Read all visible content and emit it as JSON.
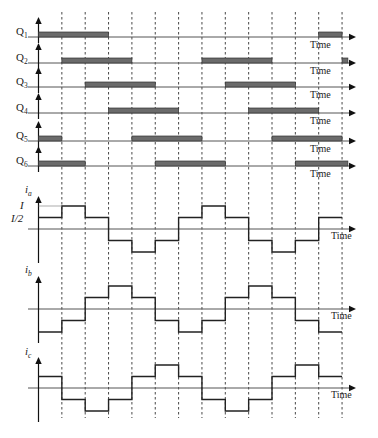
{
  "colors": {
    "bar": "#6b6b6b",
    "line": "#222222",
    "background": "#ffffff"
  },
  "axis_label": "Time",
  "gate_signals": [
    {
      "name": "Q",
      "sub": "1",
      "on_intervals": [
        [
          0,
          3
        ],
        [
          12,
          13
        ]
      ]
    },
    {
      "name": "Q",
      "sub": "2",
      "on_intervals": [
        [
          1,
          4
        ],
        [
          7,
          10
        ],
        [
          13,
          13.25
        ]
      ]
    },
    {
      "name": "Q",
      "sub": "3",
      "on_intervals": [
        [
          2,
          5
        ],
        [
          8,
          11
        ]
      ]
    },
    {
      "name": "Q",
      "sub": "4",
      "on_intervals": [
        [
          3,
          6
        ],
        [
          9,
          12
        ]
      ]
    },
    {
      "name": "Q",
      "sub": "5",
      "on_intervals": [
        [
          0,
          1
        ],
        [
          4,
          7
        ],
        [
          10,
          13
        ]
      ]
    },
    {
      "name": "Q",
      "sub": "6",
      "on_intervals": [
        [
          0,
          2
        ],
        [
          5,
          8
        ],
        [
          11,
          13.25
        ]
      ]
    }
  ],
  "currents": [
    {
      "name": "i",
      "sub": "a",
      "levels_label_top": "I",
      "levels_label_mid": "I/2",
      "levels": [
        0.5,
        1,
        0.5,
        -0.5,
        -1,
        -0.5,
        0.5,
        1,
        0.5,
        -0.5,
        -1,
        -0.5,
        0.5
      ]
    },
    {
      "name": "i",
      "sub": "b",
      "levels": [
        -1,
        -0.5,
        0.5,
        1,
        0.5,
        -0.5,
        -1,
        -0.5,
        0.5,
        1,
        0.5,
        -0.5,
        -1
      ]
    },
    {
      "name": "i",
      "sub": "c",
      "levels": [
        0.5,
        -0.5,
        -1,
        -0.5,
        0.5,
        1,
        0.5,
        -0.5,
        -1,
        -0.5,
        0.5,
        1,
        0.5
      ]
    }
  ],
  "chart_data": {
    "type": "line",
    "xlabel": "Time",
    "x_intervals": 13,
    "interval_labels": [
      "0",
      "1",
      "2",
      "3",
      "4",
      "5",
      "6",
      "7",
      "8",
      "9",
      "10",
      "11",
      "12",
      "13"
    ],
    "grid": "vertical dashed lines at each interval boundary",
    "gate_series": [
      {
        "name": "Q1",
        "on": [
          [
            0,
            3
          ],
          [
            12,
            13
          ]
        ]
      },
      {
        "name": "Q2",
        "on": [
          [
            1,
            4
          ],
          [
            7,
            10
          ],
          [
            13,
            13.25
          ]
        ]
      },
      {
        "name": "Q3",
        "on": [
          [
            2,
            5
          ],
          [
            8,
            11
          ]
        ]
      },
      {
        "name": "Q4",
        "on": [
          [
            3,
            6
          ],
          [
            9,
            12
          ]
        ]
      },
      {
        "name": "Q5",
        "on": [
          [
            0,
            1
          ],
          [
            4,
            7
          ],
          [
            10,
            13
          ]
        ]
      },
      {
        "name": "Q6",
        "on": [
          [
            0,
            2
          ],
          [
            5,
            8
          ],
          [
            11,
            13.25
          ]
        ]
      }
    ],
    "series": [
      {
        "name": "ia",
        "values": [
          0.5,
          1,
          0.5,
          -0.5,
          -1,
          -0.5,
          0.5,
          1,
          0.5,
          -0.5,
          -1,
          -0.5,
          0.5
        ]
      },
      {
        "name": "ib",
        "values": [
          -1,
          -0.5,
          0.5,
          1,
          0.5,
          -0.5,
          -1,
          -0.5,
          0.5,
          1,
          0.5,
          -0.5,
          -1
        ]
      },
      {
        "name": "ic",
        "values": [
          0.5,
          -0.5,
          -1,
          -0.5,
          0.5,
          1,
          0.5,
          -0.5,
          -1,
          -0.5,
          0.5,
          1,
          0.5
        ]
      }
    ],
    "ylabel_ticks": [
      "I",
      "I/2"
    ],
    "units": "multiples of I"
  }
}
